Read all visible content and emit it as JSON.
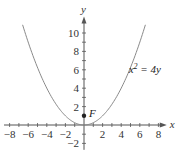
{
  "chart_data": {
    "type": "line",
    "title": "",
    "xlabel": "x",
    "ylabel": "y",
    "xlim": [
      -8.6,
      8.9
    ],
    "ylim": [
      -2.7,
      11.8
    ],
    "grid": false,
    "x_ticks": [
      -8,
      -7,
      -6,
      -5,
      -4,
      -3,
      -2,
      -1,
      1,
      2,
      3,
      4,
      5,
      6,
      7,
      8
    ],
    "x_tick_labels": [
      {
        "value": -8,
        "label": "−8"
      },
      {
        "value": -6,
        "label": "−6"
      },
      {
        "value": -4,
        "label": "−4"
      },
      {
        "value": -2,
        "label": "−2"
      },
      {
        "value": 2,
        "label": "2"
      },
      {
        "value": 4,
        "label": "4"
      },
      {
        "value": 6,
        "label": "6"
      },
      {
        "value": 8,
        "label": "8"
      }
    ],
    "y_ticks": [
      -2,
      -1,
      1,
      2,
      3,
      4,
      5,
      6,
      7,
      8,
      9,
      10
    ],
    "y_tick_labels": [
      {
        "value": -2,
        "label": "−2"
      },
      {
        "value": 2,
        "label": "2"
      },
      {
        "value": 4,
        "label": "4"
      },
      {
        "value": 6,
        "label": "6"
      },
      {
        "value": 8,
        "label": "8"
      },
      {
        "value": 10,
        "label": "10"
      }
    ],
    "series": [
      {
        "name": "x² = 4y",
        "equation": "y = x^2 / 4",
        "x_range": [
          -6.6,
          6.6
        ],
        "color": "#8a8a8a"
      }
    ],
    "points": [
      {
        "name": "F",
        "x": 0,
        "y": 1,
        "label": "F"
      }
    ],
    "annotations": [
      {
        "text_base": "x",
        "text_sup": "2",
        "text_rest": " = 4y",
        "x": 4.8,
        "y": 5.7
      }
    ]
  }
}
